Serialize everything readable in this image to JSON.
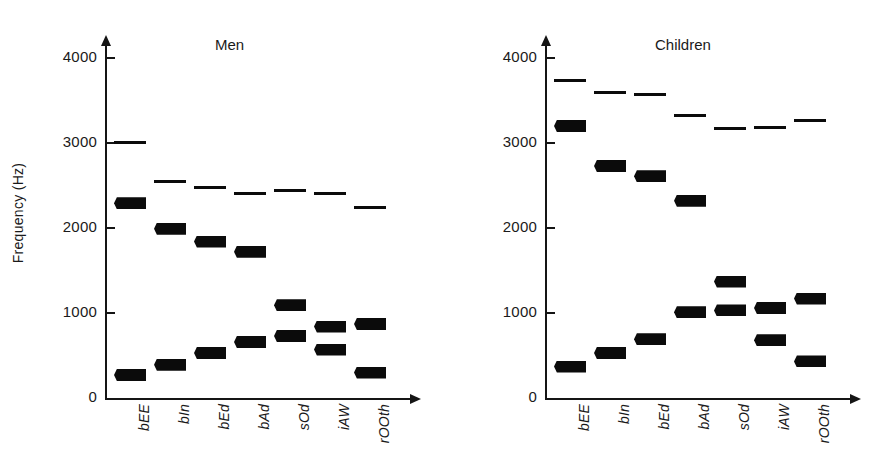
{
  "figure": {
    "axis_label_y": "Frequency (Hz)",
    "y_ticks": [
      "0",
      "1000",
      "2000",
      "3000",
      "4000"
    ],
    "y_tick_values": [
      0,
      1000,
      2000,
      3000,
      4000
    ],
    "categories": [
      "bEE",
      "bIn",
      "bEd",
      "bAd",
      "sOd",
      "iAW",
      "rOOth"
    ]
  },
  "chart_data": {
    "type": "scatter",
    "xlabel": "",
    "ylabel": "Frequency (Hz)",
    "ylim": [
      0,
      4200
    ],
    "yticks": [
      0,
      1000,
      2000,
      3000,
      4000
    ],
    "grid": false,
    "legend": "none",
    "categories": [
      "bEE",
      "bIn",
      "bEd",
      "bAd",
      "sOd",
      "iAW",
      "rOOth"
    ],
    "panels": [
      {
        "name": "Men",
        "title": "Men",
        "series": [
          {
            "name": "F1",
            "values": [
              270,
              390,
              530,
              660,
              730,
              570,
              300
            ],
            "weight": "thick"
          },
          {
            "name": "F2",
            "values": [
              2290,
              1990,
              1840,
              1720,
              1090,
              840,
              870
            ],
            "weight": "thick"
          },
          {
            "name": "F3",
            "values": [
              3010,
              2550,
              2480,
              2410,
              2440,
              2410,
              2240
            ],
            "weight": "thin"
          }
        ]
      },
      {
        "name": "Children",
        "title": "Children",
        "series": [
          {
            "name": "F1",
            "values": [
              370,
              530,
              690,
              1010,
              1030,
              680,
              430
            ],
            "weight": "thick"
          },
          {
            "name": "F2",
            "values": [
              3200,
              2730,
              2610,
              2320,
              1370,
              1060,
              1170
            ],
            "weight": "thick"
          },
          {
            "name": "F3",
            "values": [
              3730,
              3600,
              3570,
              3320,
              3170,
              3180,
              3260
            ],
            "weight": "thin"
          }
        ]
      }
    ]
  }
}
